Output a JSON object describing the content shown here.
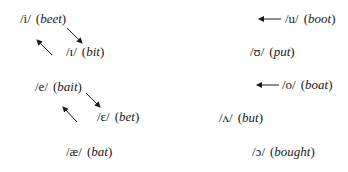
{
  "diagram": {
    "type": "vowel-shift-chart",
    "colors": {
      "text": "#1a1a1a",
      "arrow": "#1a1a1a",
      "background": "#ffffff"
    },
    "front_vowels": [
      {
        "ipa": "/i/",
        "word": "beet"
      },
      {
        "ipa": "/ɪ/",
        "word": "bit"
      },
      {
        "ipa": "/e/",
        "word": "bait"
      },
      {
        "ipa": "/ɛ/",
        "word": "bet"
      },
      {
        "ipa": "/æ/",
        "word": "bat"
      }
    ],
    "back_vowels": [
      {
        "ipa": "/u/",
        "word": "boot"
      },
      {
        "ipa": "/ʊ/",
        "word": "put"
      },
      {
        "ipa": "/o/",
        "word": "boat"
      },
      {
        "ipa": "/ʌ/",
        "word": "but"
      },
      {
        "ipa": "/ɔ/",
        "word": "bought"
      }
    ],
    "arrows": [
      {
        "id": "beet-to-bit",
        "direction": "down-right"
      },
      {
        "id": "bit-to-beet",
        "direction": "up-left"
      },
      {
        "id": "bait-to-bet",
        "direction": "down-right"
      },
      {
        "id": "bet-to-bait",
        "direction": "up-left"
      },
      {
        "id": "boot-fronting",
        "direction": "left"
      },
      {
        "id": "boat-fronting",
        "direction": "left"
      }
    ]
  }
}
